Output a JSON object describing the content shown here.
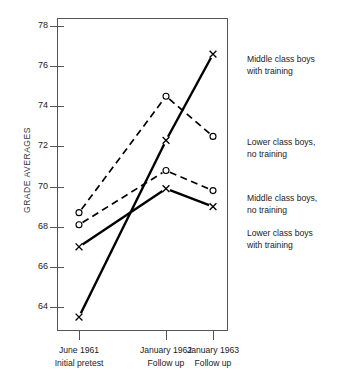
{
  "chart_data": {
    "type": "line",
    "title": "",
    "xlabel": "",
    "ylabel": "GRADE AVERAGES",
    "grid": false,
    "legend_position": "right",
    "ylim": [
      62.8,
      78.6
    ],
    "yticks": [
      64,
      66,
      68,
      70,
      72,
      74,
      76,
      78
    ],
    "ytick_labels": [
      "64",
      "66",
      "68",
      "70",
      "72",
      "74",
      "76",
      "78"
    ],
    "categories": [
      "June 1961",
      "January 1962",
      "January 1963"
    ],
    "x_sublabels": [
      "Initial pretest",
      "Follow up",
      "Follow up"
    ],
    "series": [
      {
        "name": "Middle class boys with training",
        "name_line1": "Middle class boys",
        "name_line2": "with training",
        "values": [
          63.5,
          72.3,
          76.6
        ],
        "marker": "x",
        "line_style": "solid",
        "color": "#000000",
        "legend_y": 53
      },
      {
        "name": "Lower class boys, no training",
        "name_line1": "Lower class boys,",
        "name_line2": "no training",
        "values": [
          68.7,
          74.5,
          72.5
        ],
        "marker": "circle",
        "line_style": "dashed",
        "color": "#000000",
        "legend_y": 136
      },
      {
        "name": "Middle class boys, no training",
        "name_line1": "Middle class boys,",
        "name_line2": "no training",
        "values": [
          68.1,
          70.8,
          69.8
        ],
        "marker": "circle",
        "line_style": "dashed",
        "color": "#000000",
        "legend_y": 192
      },
      {
        "name": "Lower class boys with training",
        "name_line1": "Lower class boys",
        "name_line2": "with training",
        "values": [
          67.0,
          69.9,
          69.0
        ],
        "marker": "x",
        "line_style": "solid",
        "color": "#000000",
        "legend_y": 227
      }
    ]
  }
}
